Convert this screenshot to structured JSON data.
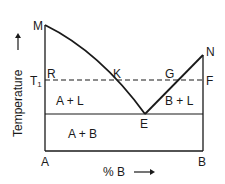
{
  "diagram": {
    "type": "binary eutectic phase diagram",
    "axis": {
      "y_label": "Temperature",
      "x_label": "% B",
      "left_component": "A",
      "right_component": "B"
    },
    "points": {
      "M": "M",
      "N": "N",
      "K": "K",
      "G": "G",
      "E": "E",
      "R": "R",
      "F": "F"
    },
    "temperature_marker": "T",
    "temperature_marker_sub": "1",
    "regions": {
      "a_plus_l": "A + L",
      "b_plus_l": "B + L",
      "a_plus_b": "A + B"
    }
  }
}
